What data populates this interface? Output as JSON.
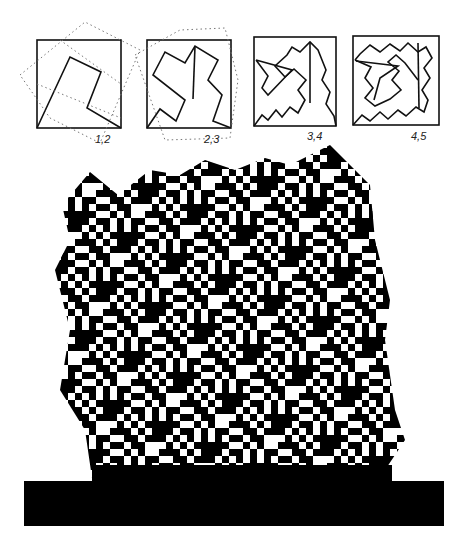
{
  "figure": {
    "type": "construction-diagram-and-mosaic"
  },
  "steps": [
    {
      "label": "1,2",
      "box": [
        37,
        40,
        121,
        128
      ]
    },
    {
      "label": "2,3",
      "box": [
        147,
        40,
        231,
        128
      ]
    },
    {
      "label": "3,4",
      "box": [
        254,
        37,
        336,
        126
      ]
    },
    {
      "label": "4,5",
      "box": [
        353,
        36,
        439,
        125
      ]
    }
  ],
  "mosaic": {
    "unit_px": 7,
    "ink": "#000000",
    "paper": "#ffffff",
    "base_band": {
      "x": 24,
      "y": 481,
      "width": 420,
      "height": 45
    }
  }
}
